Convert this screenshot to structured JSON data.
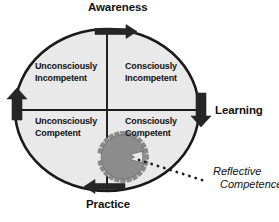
{
  "diagram": {
    "title_labels": {
      "top": "Awareness",
      "right": "Learning",
      "bottom": "Practice"
    },
    "quadrants": [
      {
        "id": "unconsciously-incompetent",
        "line1": "Unconsciously",
        "line2": "Incompetent",
        "position": "top-left"
      },
      {
        "id": "consciously-incompetent",
        "line1": "Consciously",
        "line2": "Incompetent",
        "position": "top-right"
      },
      {
        "id": "unconsciously-competent",
        "line1": "Unconsciously",
        "line2": "Competent",
        "position": "bottom-left"
      },
      {
        "id": "consciously-competent",
        "line1": "Consciously",
        "line2": "Competent",
        "position": "bottom-right"
      }
    ],
    "annotation": {
      "line1": "Reflective",
      "line2": "Competence"
    },
    "arrows": [
      {
        "name": "top-arrow",
        "direction": "right"
      },
      {
        "name": "right-arrow",
        "direction": "down"
      },
      {
        "name": "bottom-arrow",
        "direction": "left"
      },
      {
        "name": "left-arrow",
        "direction": "up"
      }
    ],
    "icons": {
      "gear": "gear-icon",
      "connector": "dotted-leader-line"
    },
    "colors": {
      "ellipse_fill": "#e9e9e9",
      "outline": "#1a1a1a",
      "gear_fill": "#8c8c8c",
      "gear_outline": "#6f6f6f",
      "arrow_fill": "#262626",
      "text": "#111111",
      "background": "#ffffff"
    }
  }
}
